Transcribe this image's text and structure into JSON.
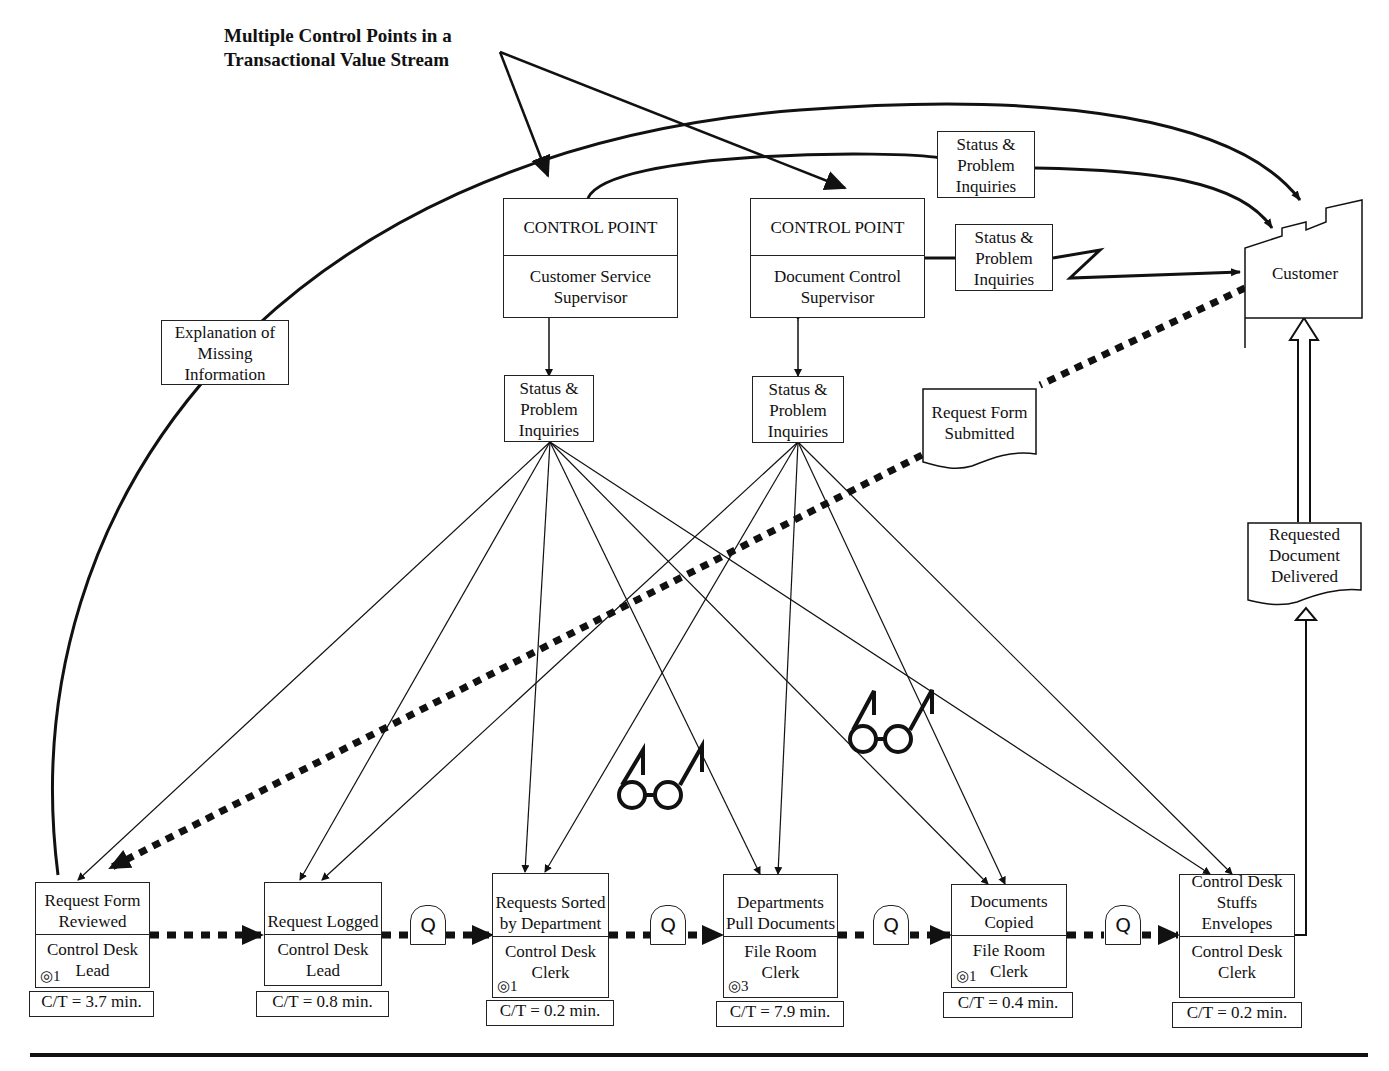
{
  "title": {
    "line1": "Multiple Control Points in a",
    "line2": "Transactional Value Stream"
  },
  "control_points": [
    {
      "header": "CONTROL POINT",
      "role": "Customer Service Supervisor"
    },
    {
      "header": "CONTROL POINT",
      "role": "Document Control Supervisor"
    }
  ],
  "info_boxes": {
    "status_top": "Status & Problem Inquiries",
    "status_mid": "Status & Problem Inquiries",
    "status_cp1": "Status & Problem Inquiries",
    "status_cp2": "Status & Problem Inquiries",
    "explanation": "Explanation of Missing Information"
  },
  "documents": {
    "request_form": "Request Form Submitted",
    "requested_doc": "Requested Document Delivered"
  },
  "customer": {
    "label": "Customer"
  },
  "processes": [
    {
      "name": "Request Form Reviewed",
      "owner": "Control Desk Lead",
      "operators": "1",
      "ct": "C/T = 3.7 min."
    },
    {
      "name": "Request Logged",
      "owner": "Control Desk Lead",
      "operators": "",
      "ct": "C/T = 0.8 min."
    },
    {
      "name": "Requests Sorted by Department",
      "owner": "Control Desk Clerk",
      "operators": "1",
      "ct": "C/T = 0.2 min."
    },
    {
      "name": "Departments Pull Documents",
      "owner": "File Room Clerk",
      "operators": "3",
      "ct": "C/T = 7.9 min."
    },
    {
      "name": "Documents Copied",
      "owner": "File Room Clerk",
      "operators": "1",
      "ct": "C/T = 0.4 min."
    },
    {
      "name": "Control Desk Stuffs Envelopes",
      "owner": "Control Desk Clerk",
      "operators": "",
      "ct": "C/T = 0.2 min."
    }
  ],
  "queue_label": "Q",
  "operator_icon": "operator-icon",
  "go_see_icon": "glasses-icon"
}
